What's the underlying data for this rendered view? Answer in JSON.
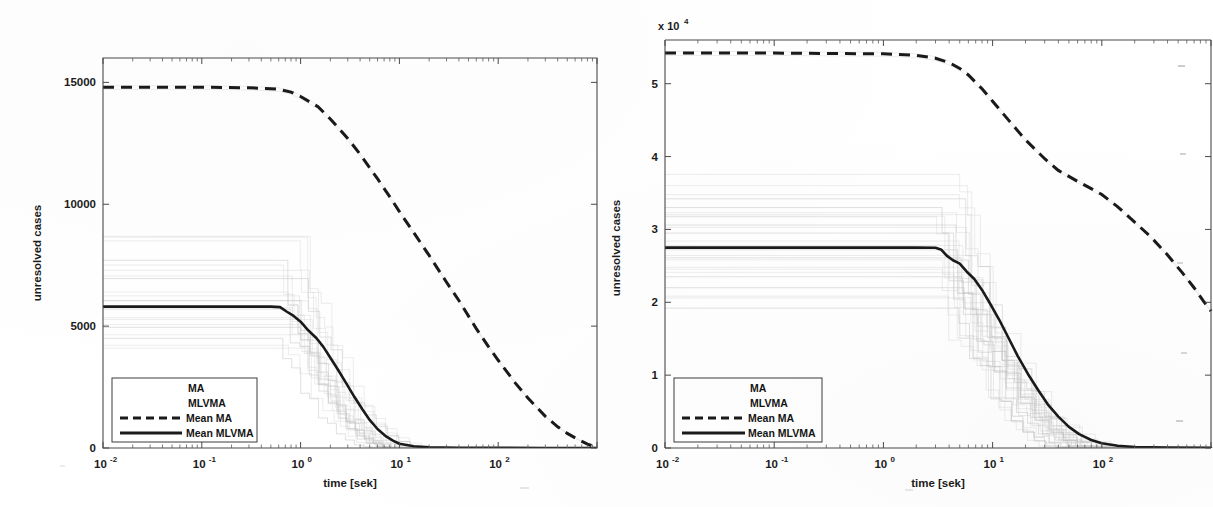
{
  "figure": {
    "panel_count": 2,
    "background": "#ffffff",
    "ink_color": "#1a1a1a",
    "trace_color": "#b9b9b9"
  },
  "chart_data": [
    {
      "id": "left",
      "type": "line",
      "title": "",
      "xlabel": "time [sek]",
      "ylabel": "unresolved cases",
      "xscale": "log",
      "yscale": "linear",
      "xlim": [
        0.01,
        1000
      ],
      "ylim": [
        0,
        16000
      ],
      "xticks": [
        0.01,
        0.1,
        1,
        10,
        100
      ],
      "xticklabels": [
        "10-2",
        "10-1",
        "100",
        "101",
        "102"
      ],
      "xtick_mantissa": [
        "10",
        "10",
        "10",
        "10",
        "10"
      ],
      "xtick_exponent": [
        "-2",
        "-1",
        "0",
        "1",
        "2"
      ],
      "yticks": [
        0,
        5000,
        10000,
        15000
      ],
      "yticklabels": [
        "0",
        "5000",
        "10000",
        "15000"
      ],
      "y_multiplier": "",
      "grid": false,
      "legend_position": "lower left",
      "legend": [
        "MA",
        "MLVMA",
        "Mean MA",
        "Mean MLVMA"
      ],
      "series": [
        {
          "name": "Mean MA",
          "style": "dashed",
          "color": "#1a1a1a",
          "x": [
            0.01,
            0.1,
            0.3,
            0.6,
            0.8,
            1.0,
            1.5,
            2,
            3,
            4,
            6,
            8,
            10,
            15,
            20,
            30,
            40,
            60,
            80,
            100,
            150,
            200,
            300,
            400,
            500,
            650,
            800,
            1000
          ],
          "y": [
            14800,
            14800,
            14780,
            14720,
            14600,
            14420,
            14000,
            13500,
            12700,
            12050,
            11050,
            10300,
            9700,
            8650,
            7900,
            6800,
            6050,
            4900,
            4150,
            3600,
            2650,
            2050,
            1300,
            870,
            600,
            340,
            160,
            20
          ]
        },
        {
          "name": "Mean MLVMA",
          "style": "solid",
          "color": "#1a1a1a",
          "x": [
            0.01,
            0.1,
            0.3,
            0.5,
            0.62,
            0.72,
            0.85,
            1.0,
            1.2,
            1.45,
            1.7,
            2.0,
            2.4,
            2.9,
            3.5,
            4.2,
            5.0,
            6.0,
            7.2,
            8.6,
            10,
            14,
            20,
            40,
            100,
            300,
            1000
          ],
          "y": [
            5800,
            5800,
            5800,
            5800,
            5780,
            5600,
            5420,
            5180,
            4820,
            4500,
            4150,
            3700,
            3200,
            2650,
            2100,
            1600,
            1150,
            780,
            500,
            300,
            175,
            70,
            30,
            10,
            4,
            2,
            1
          ]
        }
      ],
      "spaghetti_plateaus_ma": [
        8500,
        7700,
        6950,
        6400,
        6050,
        5700,
        5350,
        4950,
        4500,
        4100
      ],
      "spaghetti_plateaus_mlvma": [
        8500,
        7700,
        6950,
        6400,
        6050,
        5700,
        5350,
        4950,
        4500,
        4100
      ],
      "spaghetti_count": 22,
      "annotations": []
    },
    {
      "id": "right",
      "type": "line",
      "title": "",
      "xlabel": "time [sek]",
      "ylabel": "unresolved cases",
      "xscale": "log",
      "yscale": "linear",
      "xlim": [
        0.01,
        1000
      ],
      "ylim": [
        0,
        56000
      ],
      "xticks": [
        0.01,
        0.1,
        1,
        10,
        100
      ],
      "xticklabels": [
        "10-2",
        "10-1",
        "100",
        "101",
        "102"
      ],
      "xtick_mantissa": [
        "10",
        "10",
        "10",
        "10",
        "10"
      ],
      "xtick_exponent": [
        "-2",
        "-1",
        "0",
        "1",
        "2"
      ],
      "yticks": [
        0,
        10000,
        20000,
        30000,
        40000,
        50000
      ],
      "yticklabels": [
        "0",
        "1",
        "2",
        "3",
        "4",
        "5"
      ],
      "y_multiplier": "x 10",
      "y_multiplier_exponent": "4",
      "grid": false,
      "legend_position": "lower left",
      "legend": [
        "MA",
        "MLVMA",
        "Mean MA",
        "Mean MLVMA"
      ],
      "series": [
        {
          "name": "Mean MA",
          "style": "dashed",
          "color": "#1a1a1a",
          "x": [
            0.01,
            0.1,
            1,
            2,
            3,
            4,
            5,
            6,
            8,
            10,
            14,
            20,
            30,
            40,
            60,
            80,
            100,
            140,
            200,
            280,
            400,
            550,
            700,
            850,
            1000
          ],
          "y": [
            54200,
            54200,
            54100,
            53900,
            53500,
            52900,
            52100,
            51200,
            49300,
            47600,
            45000,
            42300,
            39700,
            38100,
            36600,
            35600,
            34800,
            33100,
            31000,
            29000,
            26500,
            24000,
            22000,
            20200,
            18800
          ]
        },
        {
          "name": "Mean MLVMA",
          "style": "solid",
          "color": "#1a1a1a",
          "x": [
            0.01,
            0.1,
            1,
            2,
            3,
            3.4,
            3.8,
            4.3,
            5.0,
            5.8,
            6.8,
            8.0,
            9.5,
            11.5,
            14,
            17,
            21,
            26,
            32,
            40,
            50,
            62,
            80,
            100,
            140,
            200,
            400,
            1000
          ],
          "y": [
            27500,
            27500,
            27500,
            27500,
            27480,
            27200,
            26400,
            25800,
            25300,
            24200,
            23200,
            21700,
            19800,
            17600,
            15100,
            12600,
            10200,
            8000,
            6000,
            4300,
            2900,
            1900,
            1100,
            650,
            300,
            140,
            50,
            20
          ]
        }
      ],
      "spaghetti_plateaus_ma": [
        36000,
        34200,
        33000,
        31800,
        30600,
        29500,
        28400,
        27200,
        26100,
        24800,
        23500,
        22000,
        20600,
        19200
      ],
      "spaghetti_plateaus_mlvma": [
        36000,
        34200,
        33000,
        31800,
        30600,
        29500,
        28400,
        27200,
        26100,
        24800,
        23500,
        22000,
        20600,
        19200
      ],
      "spaghetti_count": 26,
      "annotations": []
    }
  ]
}
